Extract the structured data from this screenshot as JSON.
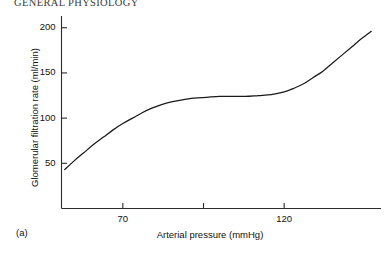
{
  "running_head": "GENERAL PHYSIOLOGY",
  "panel": {
    "label": "(a)"
  },
  "chart_data": {
    "type": "line",
    "title": "",
    "subtitle": "",
    "xlabel": "Arterial pressure (mmHg)",
    "ylabel": "Glomerular filtration rate (ml/min)",
    "xlim": [
      51,
      150
    ],
    "ylim": [
      0,
      213
    ],
    "grid": false,
    "legend": null,
    "x_ticks": [
      {
        "value": 70,
        "label": "70"
      },
      {
        "value": 95,
        "label": ""
      },
      {
        "value": 120,
        "label": "120"
      }
    ],
    "y_ticks": [
      {
        "value": 50,
        "label": "50"
      },
      {
        "value": 100,
        "label": "100"
      },
      {
        "value": 150,
        "label": "150"
      },
      {
        "value": 200,
        "label": "200"
      }
    ],
    "series": [
      {
        "name": "Glomerular filtration rate",
        "color": "#1a1a1a",
        "x": [
          52,
          55,
          58,
          61,
          64,
          67,
          70,
          73,
          76,
          79,
          82,
          85,
          88,
          92,
          96,
          100,
          104,
          108,
          112,
          116,
          120,
          123,
          126,
          129,
          132,
          135,
          138,
          141,
          144,
          147
        ],
        "y": [
          43,
          53,
          62,
          71,
          79,
          87,
          94,
          100,
          106,
          111,
          115,
          118,
          120,
          122,
          123,
          124,
          124,
          124,
          125,
          126,
          129,
          133,
          138,
          145,
          152,
          161,
          170,
          179,
          188,
          196
        ]
      }
    ],
    "annotations": [
      {
        "text": "autoregulatory plateau",
        "x_range": [
          80,
          120
        ],
        "y_approx": 124
      }
    ],
    "colors": {
      "curve": "#1a1a1a",
      "axis": "#2b2b2b",
      "background": "#ffffff",
      "text": "#111111"
    }
  }
}
